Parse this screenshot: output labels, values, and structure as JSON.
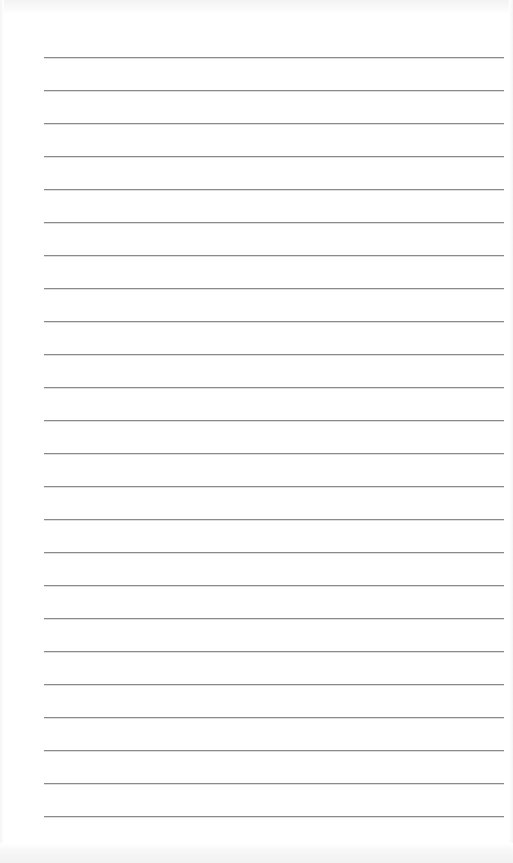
{
  "paper": {
    "type": "ruled-notebook-page",
    "background_color": "#ffffff",
    "line_color": "#8a8a8a",
    "line_count": 24,
    "line_left_px": 44,
    "line_right_px": 504,
    "first_line_y": 57,
    "line_spacing_px": 33
  }
}
